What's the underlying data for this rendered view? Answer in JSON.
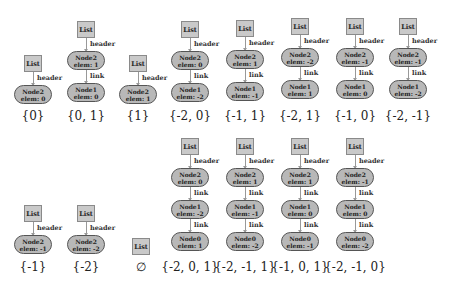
{
  "labels": {
    "list": "List",
    "header": "header",
    "link": "link"
  },
  "diagrams": [
    {
      "set": "{0}",
      "nodes": [
        {
          "name": "Node2",
          "elem": "elem: 0"
        }
      ]
    },
    {
      "set": "{0, 1}",
      "nodes": [
        {
          "name": "Node2",
          "elem": "elem: 1"
        },
        {
          "name": "Node1",
          "elem": "elem: 0"
        }
      ]
    },
    {
      "set": "{1}",
      "nodes": [
        {
          "name": "Node2",
          "elem": "elem: 1"
        }
      ]
    },
    {
      "set": "{-2, 0}",
      "nodes": [
        {
          "name": "Node2",
          "elem": "elem: 0"
        },
        {
          "name": "Node1",
          "elem": "elem: -2"
        }
      ]
    },
    {
      "set": "{-1, 1}",
      "nodes": [
        {
          "name": "Node2",
          "elem": "elem: 1"
        },
        {
          "name": "Node1",
          "elem": "elem: -1"
        }
      ]
    },
    {
      "set": "{-2, 1}",
      "nodes": [
        {
          "name": "Node2",
          "elem": "elem: -2"
        },
        {
          "name": "Node1",
          "elem": "elem: 1"
        }
      ]
    },
    {
      "set": "{-1, 0}",
      "nodes": [
        {
          "name": "Node2",
          "elem": "elem: -1"
        },
        {
          "name": "Node1",
          "elem": "elem: 0"
        }
      ]
    },
    {
      "set": "{-2, -1}",
      "nodes": [
        {
          "name": "Node2",
          "elem": "elem: -1"
        },
        {
          "name": "Node1",
          "elem": "elem: -2"
        }
      ]
    },
    {
      "set": "{-1}",
      "nodes": [
        {
          "name": "Node2",
          "elem": "elem: -1"
        }
      ]
    },
    {
      "set": "{-2}",
      "nodes": [
        {
          "name": "Node2",
          "elem": "elem: -2"
        }
      ]
    },
    {
      "set": "∅",
      "nodes": []
    },
    {
      "set": "{-2, 0, 1}",
      "nodes": [
        {
          "name": "Node2",
          "elem": "elem: 0"
        },
        {
          "name": "Node1",
          "elem": "elem: -2"
        },
        {
          "name": "Node0",
          "elem": "elem: 1"
        }
      ]
    },
    {
      "set": "{-2, -1, 1}",
      "nodes": [
        {
          "name": "Node2",
          "elem": "elem: 1"
        },
        {
          "name": "Node1",
          "elem": "elem: -1"
        },
        {
          "name": "Node0",
          "elem": "elem: -2"
        }
      ]
    },
    {
      "set": "{-1, 0, 1}",
      "nodes": [
        {
          "name": "Node2",
          "elem": "elem: 1"
        },
        {
          "name": "Node1",
          "elem": "elem: 0"
        },
        {
          "name": "Node0",
          "elem": "elem: -1"
        }
      ]
    },
    {
      "set": "{-2, -1, 0}",
      "nodes": [
        {
          "name": "Node2",
          "elem": "elem: -1"
        },
        {
          "name": "Node1",
          "elem": "elem: 0"
        },
        {
          "name": "Node0",
          "elem": "elem: -2"
        }
      ]
    }
  ]
}
